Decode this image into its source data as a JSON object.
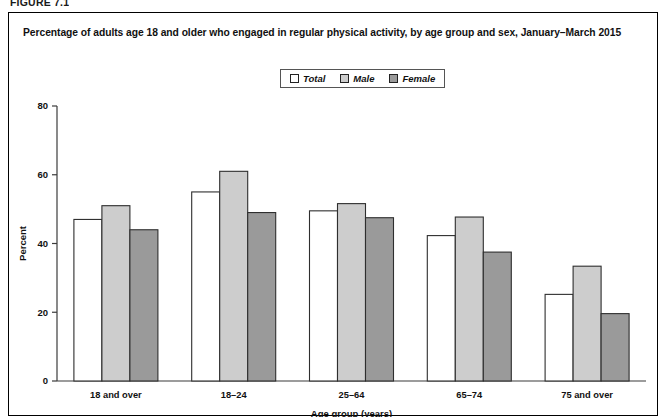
{
  "figure": {
    "number": "FIGURE 7.1"
  },
  "title": "Percentage of adults age 18 and older who engaged in regular physical activity, by age group and sex, January–March 2015",
  "legend": {
    "position": "top-center",
    "entries": [
      {
        "label": "Total",
        "color": "#ffffff"
      },
      {
        "label": "Male",
        "color": "#cdcdcd"
      },
      {
        "label": "Female",
        "color": "#9a9a9a"
      }
    ]
  },
  "chart_data": {
    "type": "bar",
    "title": "Percentage of adults age 18 and older who engaged in regular physical activity, by age group and sex, January–March 2015",
    "xlabel": "Age group (years)",
    "ylabel": "Percent",
    "categories": [
      "18 and over",
      "18–24",
      "25–64",
      "65–74",
      "75 and over"
    ],
    "series": [
      {
        "name": "Total",
        "color": "#ffffff",
        "values": [
          47.0,
          55.0,
          49.5,
          42.3,
          25.2
        ]
      },
      {
        "name": "Male",
        "color": "#cdcdcd",
        "values": [
          51.0,
          61.0,
          51.6,
          47.7,
          33.4
        ]
      },
      {
        "name": "Female",
        "color": "#9a9a9a",
        "values": [
          44.0,
          49.0,
          47.5,
          37.5,
          19.6
        ]
      }
    ],
    "ylim": [
      0,
      80
    ],
    "yticks": [
      0,
      20,
      40,
      60,
      80
    ],
    "ytick_labels": [
      "0",
      "20",
      "40",
      "60",
      "80"
    ],
    "grid": false,
    "legend_position": "top-center"
  }
}
